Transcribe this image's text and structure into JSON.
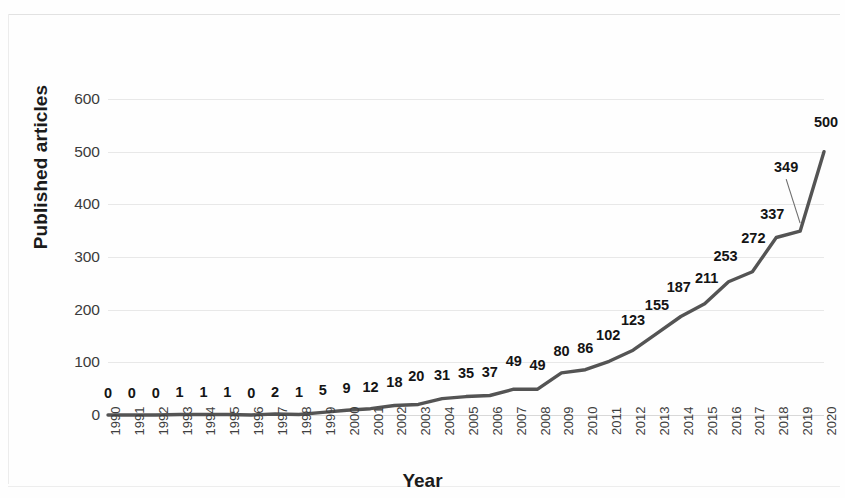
{
  "chart_data": {
    "type": "line",
    "title": "",
    "xlabel": "Year",
    "ylabel": "Published articles",
    "categories": [
      "1990",
      "1991",
      "1992",
      "1993",
      "1994",
      "1995",
      "1996",
      "1997",
      "1998",
      "1999",
      "2000",
      "2001",
      "2002",
      "2003",
      "2004",
      "2005",
      "2006",
      "2007",
      "2008",
      "2009",
      "2010",
      "2011",
      "2012",
      "2013",
      "2014",
      "2015",
      "2016",
      "2017",
      "2018",
      "2019",
      "2020"
    ],
    "values": [
      0,
      0,
      0,
      1,
      1,
      1,
      0,
      2,
      1,
      5,
      9,
      12,
      18,
      20,
      31,
      35,
      37,
      49,
      49,
      80,
      86,
      102,
      123,
      155,
      187,
      211,
      253,
      272,
      337,
      349,
      500
    ],
    "ylim": [
      0,
      600
    ],
    "yticks": [
      "0",
      "100",
      "200",
      "300",
      "400",
      "500",
      "600"
    ],
    "ytick_values": [
      0,
      100,
      200,
      300,
      400,
      500,
      600
    ],
    "grid": "horizontal",
    "legend": "none",
    "series_color": "#545454",
    "data_labels": [
      "0",
      "0",
      "0",
      "1",
      "1",
      "1",
      "0",
      "2",
      "1",
      "5",
      "9",
      "12",
      "18",
      "20",
      "31",
      "35",
      "37",
      "49",
      "49",
      "80",
      "86",
      "102",
      "123",
      "155",
      "187",
      "211",
      "253",
      "272",
      "337",
      "349",
      "500"
    ],
    "leader_line_label": "349"
  }
}
